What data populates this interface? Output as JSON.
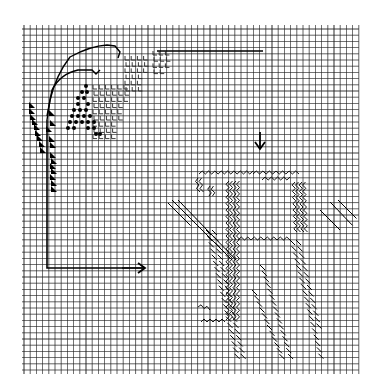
{
  "grid": {
    "x0": 24,
    "y0": 29,
    "cell": 6.2,
    "cols": 54,
    "rows": 55,
    "line_color": "#1a1a1a",
    "background": "#ffffff"
  },
  "markers": {
    "down_arrow": {
      "x": 260,
      "y1": 132,
      "y2": 149,
      "label": "down-arrow"
    },
    "right_arrow": {
      "x1": 122,
      "x2": 145,
      "y": 268,
      "label": "right-arrow"
    }
  },
  "guide_lines": [
    {
      "name": "top-horizontal-line",
      "points": [
        [
          157,
          51
        ],
        [
          263,
          51
        ]
      ]
    },
    {
      "name": "vertical-left-line",
      "points": [
        [
          47,
          120
        ],
        [
          47,
          268
        ],
        [
          122,
          268
        ]
      ]
    }
  ],
  "curves": [
    {
      "name": "outer-stem-curve",
      "d": "M47,120 L50,100 Q56,75 70,57 Q90,46 107,45 L115,46 L120,52 L118,58"
    },
    {
      "name": "inner-stem-curve",
      "d": "M47,116 L52,90 Q60,74 78,70 L92,70 L96,74 L100,70"
    }
  ],
  "stitches": {
    "triangles": [
      [
        29,
        102
      ],
      [
        29,
        108
      ],
      [
        30,
        114
      ],
      [
        32,
        119
      ],
      [
        34,
        124
      ],
      [
        35,
        130
      ],
      [
        37,
        135
      ],
      [
        39,
        141
      ],
      [
        40,
        147
      ],
      [
        50,
        152
      ],
      [
        51,
        158
      ],
      [
        50,
        163
      ],
      [
        51,
        168
      ],
      [
        50,
        174
      ],
      [
        51,
        180
      ],
      [
        51,
        186
      ],
      [
        49,
        110
      ],
      [
        50,
        120
      ],
      [
        46,
        126
      ],
      [
        49,
        136
      ],
      [
        50,
        142
      ]
    ],
    "dots": [
      [
        86,
        86
      ],
      [
        82,
        92
      ],
      [
        87,
        92
      ],
      [
        78,
        98
      ],
      [
        84,
        98
      ],
      [
        88,
        104
      ],
      [
        78,
        104
      ],
      [
        74,
        110
      ],
      [
        80,
        110
      ],
      [
        86,
        110
      ],
      [
        72,
        116
      ],
      [
        78,
        116
      ],
      [
        84,
        116
      ],
      [
        90,
        116
      ],
      [
        70,
        122
      ],
      [
        76,
        122
      ],
      [
        82,
        122
      ],
      [
        88,
        122
      ],
      [
        94,
        122
      ],
      [
        68,
        128
      ],
      [
        74,
        128
      ],
      [
        88,
        128
      ],
      [
        94,
        128
      ],
      [
        100,
        134
      ],
      [
        96,
        134
      ]
    ],
    "ells_area_1": {
      "x": 92,
      "y": 84,
      "cols": 6,
      "rows": 9
    },
    "ells_area_2": {
      "x": 124,
      "y": 55,
      "cols": 4,
      "rows": 6
    },
    "ells_area_3": {
      "x": 152,
      "y": 50,
      "cols": 3,
      "rows": 4
    }
  },
  "figure": {
    "name": "tulip-plant-motif",
    "zigzag_paths": [
      "M199,174 L253,174",
      "M253,174 L299,174",
      "M262,180 L290,180",
      "M229,181 L229,320",
      "M236,181 L236,320",
      "M295,182 L297,232",
      "M302,182 L304,232",
      "M238,240 L290,240",
      "M198,178 L200,192",
      "M210,186 L212,196",
      "M201,322 L225,322",
      "M198,307 L210,310"
    ],
    "hatch_lines": [
      {
        "x1": 168,
        "y1": 203,
        "x2": 190,
        "y2": 225
      },
      {
        "x1": 172,
        "y1": 200,
        "x2": 232,
        "y2": 260
      },
      {
        "x1": 178,
        "y1": 200,
        "x2": 236,
        "y2": 260
      },
      {
        "x1": 206,
        "y1": 230,
        "x2": 236,
        "y2": 360
      },
      {
        "x1": 212,
        "y1": 230,
        "x2": 242,
        "y2": 360
      },
      {
        "x1": 260,
        "y1": 265,
        "x2": 290,
        "y2": 360
      },
      {
        "x1": 252,
        "y1": 290,
        "x2": 282,
        "y2": 360
      },
      {
        "x1": 290,
        "y1": 240,
        "x2": 320,
        "y2": 360
      },
      {
        "x1": 296,
        "y1": 240,
        "x2": 318,
        "y2": 330
      },
      {
        "x1": 320,
        "y1": 210,
        "x2": 340,
        "y2": 230
      },
      {
        "x1": 330,
        "y1": 202,
        "x2": 352,
        "y2": 225
      },
      {
        "x1": 338,
        "y1": 200,
        "x2": 356,
        "y2": 218
      }
    ]
  }
}
